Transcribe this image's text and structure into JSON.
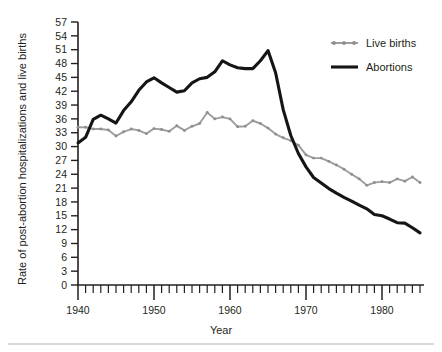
{
  "chart_data": {
    "type": "line",
    "title": "",
    "xlabel": "Year",
    "ylabel": "Rate of post-abortion hospitalizations and live births",
    "xlim": [
      1940,
      1985
    ],
    "ylim": [
      0,
      57
    ],
    "xticks": [
      1940,
      1950,
      1960,
      1970,
      1980
    ],
    "xtick_labels": [
      "1940",
      "1950",
      "1960",
      "1970",
      "1980"
    ],
    "minor_xtick_step": 1,
    "yticks": [
      0,
      3,
      6,
      9,
      12,
      15,
      18,
      21,
      24,
      27,
      30,
      33,
      36,
      39,
      42,
      45,
      48,
      51,
      54,
      57
    ],
    "ytick_labels": [
      "0",
      "3",
      "6",
      "9",
      "12",
      "15",
      "18",
      "21",
      "24",
      "27",
      "30",
      "33",
      "36",
      "39",
      "42",
      "45",
      "48",
      "51",
      "54",
      "57"
    ],
    "grid": false,
    "legend_position": "top-right",
    "x": [
      1940,
      1941,
      1942,
      1943,
      1944,
      1945,
      1946,
      1947,
      1948,
      1949,
      1950,
      1951,
      1952,
      1953,
      1954,
      1955,
      1956,
      1957,
      1958,
      1959,
      1960,
      1961,
      1962,
      1963,
      1964,
      1965,
      1966,
      1967,
      1968,
      1969,
      1970,
      1971,
      1972,
      1973,
      1974,
      1975,
      1976,
      1977,
      1978,
      1979,
      1980,
      1981,
      1982,
      1983,
      1984,
      1985
    ],
    "series": [
      {
        "name": "Live births",
        "color": "#9d9d9d",
        "style": "line-with-markers",
        "values": [
          34.2,
          34.2,
          33.8,
          33.8,
          33.6,
          32.3,
          33.2,
          33.8,
          33.5,
          32.8,
          33.9,
          33.7,
          33.3,
          34.5,
          33.5,
          34.4,
          35.0,
          37.4,
          36.0,
          36.4,
          36.0,
          34.3,
          34.4,
          35.6,
          35.0,
          34.0,
          32.7,
          31.9,
          31.3,
          30.3,
          28.2,
          27.5,
          27.5,
          26.8,
          26.0,
          25.1,
          24.0,
          23.0,
          21.6,
          22.2,
          22.4,
          22.2,
          23.0,
          22.5,
          23.4,
          22.2
        ]
      },
      {
        "name": "Abortions",
        "color": "#151515",
        "style": "line",
        "values": [
          30.8,
          32.0,
          35.9,
          36.8,
          36.0,
          35.1,
          37.8,
          39.7,
          42.2,
          44.0,
          44.9,
          43.8,
          42.8,
          41.8,
          42.1,
          43.8,
          44.7,
          45.0,
          46.2,
          48.6,
          47.7,
          47.1,
          46.9,
          46.9,
          48.6,
          50.8,
          46.0,
          38.0,
          32.4,
          28.5,
          25.6,
          23.3,
          22.1,
          20.9,
          19.9,
          19.0,
          18.2,
          17.3,
          16.5,
          15.3,
          15.0,
          14.3,
          13.5,
          13.4,
          12.4,
          11.3
        ]
      }
    ],
    "legend": [
      {
        "label": "Live births",
        "color": "#9d9d9d",
        "style": "line-with-markers"
      },
      {
        "label": "Abortions",
        "color": "#151515",
        "style": "line"
      }
    ]
  },
  "axes": {
    "y_title": "Rate of post-abortion hospitalizations and live births",
    "x_title": "Year"
  }
}
